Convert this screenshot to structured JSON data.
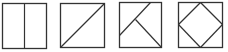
{
  "diagram": {
    "title": "",
    "stroke_color": "#333333",
    "background": "#ffffff",
    "figures": [
      {
        "id": "square-vertical-split",
        "square": {
          "x": 2,
          "y": 3,
          "w": 44,
          "h": 45
        },
        "lines": [
          {
            "x1": 24,
            "y1": 3,
            "x2": 24,
            "y2": 48
          }
        ]
      },
      {
        "id": "square-diagonal-split",
        "square": {
          "x": 60,
          "y": 3,
          "w": 44,
          "h": 44
        },
        "lines": [
          {
            "x1": 60,
            "y1": 47,
            "x2": 104,
            "y2": 3
          }
        ]
      },
      {
        "id": "square-three-piece-split",
        "square": {
          "x": 119,
          "y": 2,
          "w": 42,
          "h": 45
        },
        "lines": [
          {
            "x1": 150,
            "y1": 2,
            "x2": 119,
            "y2": 35
          },
          {
            "x1": 135,
            "y1": 19,
            "x2": 161,
            "y2": 47
          }
        ]
      },
      {
        "id": "square-inscribed-diamond",
        "square": {
          "x": 178,
          "y": 2,
          "w": 44,
          "h": 45
        },
        "lines": [
          {
            "x1": 200,
            "y1": 2,
            "x2": 222,
            "y2": 24
          },
          {
            "x1": 222,
            "y1": 24,
            "x2": 200,
            "y2": 47
          },
          {
            "x1": 200,
            "y1": 47,
            "x2": 178,
            "y2": 24
          },
          {
            "x1": 178,
            "y1": 24,
            "x2": 200,
            "y2": 2
          }
        ]
      }
    ]
  }
}
